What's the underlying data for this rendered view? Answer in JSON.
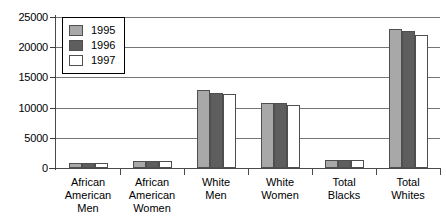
{
  "chart_data": {
    "type": "bar",
    "title": "",
    "subtitle": "",
    "xlabel": "",
    "ylabel": "",
    "ylim": [
      0,
      25000
    ],
    "ytick_step": 5000,
    "yticks": [
      "0",
      "5000",
      "10000",
      "15000",
      "20000",
      "25000"
    ],
    "ytick_values": [
      0,
      5000,
      10000,
      15000,
      20000,
      25000
    ],
    "grid": true,
    "grid_axis": "y",
    "legend_position": "upper-left-inside",
    "categories": [
      "African American Men",
      "African American Women",
      "White Men",
      "White Women",
      "Total Blacks",
      "Total Whites"
    ],
    "category_lines": [
      [
        "African",
        "American",
        "Men"
      ],
      [
        "African",
        "American",
        "Women"
      ],
      [
        "White",
        "Men"
      ],
      [
        "White",
        "Women"
      ],
      [
        "Total",
        "Blacks"
      ],
      [
        "Total",
        "Whites"
      ]
    ],
    "series": [
      {
        "name": "1995",
        "color": "#a8a8a8",
        "values": [
          900,
          1100,
          12900,
          10700,
          1250,
          23000
        ]
      },
      {
        "name": "1996",
        "color": "#5e5e5e",
        "values": [
          900,
          1100,
          12500,
          10800,
          1250,
          22700
        ]
      },
      {
        "name": "1997",
        "color": "#ffffff",
        "values": [
          900,
          1100,
          12300,
          10400,
          1250,
          22000
        ]
      }
    ]
  },
  "legend": {
    "items": [
      {
        "label": "1995",
        "swatch": "legend-swatch-1995"
      },
      {
        "label": "1996",
        "swatch": "legend-swatch-1996"
      },
      {
        "label": "1997",
        "swatch": "legend-swatch-1997"
      }
    ]
  },
  "colors": {
    "series_1995": "#a8a8a8",
    "series_1996": "#5e5e5e",
    "series_1997": "#ffffff",
    "bar_outline": "#4f4f4f",
    "axis": "#4a4a4a",
    "gridline": "#757575",
    "background": "#ffffff",
    "text": "#000000"
  }
}
